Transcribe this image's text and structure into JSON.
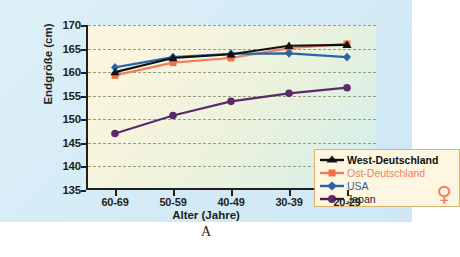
{
  "figure": {
    "caption": "A",
    "venus_symbol": "♀",
    "accent_color": "#ee7f5f",
    "legend_border_color": "#d8b36a",
    "legend_bg_color": "#fdf6e0",
    "background_color": "#d6ecf6"
  },
  "chart_data": {
    "type": "line",
    "title": "",
    "xlabel": "Alter (Jahre)",
    "ylabel": "Endgröße (cm)",
    "categories": [
      "60-69",
      "50-59",
      "40-49",
      "30-39",
      "20-29"
    ],
    "ylim": [
      135,
      170
    ],
    "yticks": [
      135,
      140,
      145,
      150,
      155,
      160,
      165,
      170
    ],
    "grid": "horizontal-dashed",
    "legend_position": "bottom-right-inside",
    "series": [
      {
        "name": "West-Deutschland",
        "color": "#111111",
        "marker": "triangle",
        "values": [
          160.0,
          163.0,
          163.8,
          165.6,
          165.8
        ]
      },
      {
        "name": "Ost-Deutschland",
        "color": "#ee7f5f",
        "marker": "square",
        "values": [
          159.3,
          162.0,
          163.0,
          165.1,
          166.0
        ]
      },
      {
        "name": "USA",
        "color": "#2a63a8",
        "marker": "diamond",
        "values": [
          161.0,
          163.2,
          163.9,
          164.0,
          163.2
        ]
      },
      {
        "name": "Japan",
        "color": "#5b2a6b",
        "marker": "circle",
        "values": [
          147.0,
          150.8,
          153.8,
          155.5,
          156.7
        ]
      }
    ]
  }
}
